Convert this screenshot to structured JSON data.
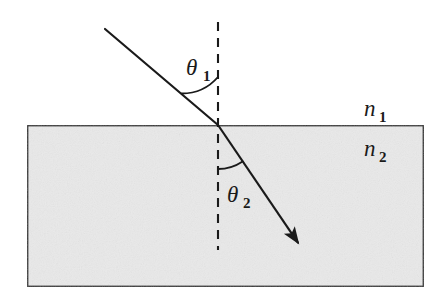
{
  "diagram": {
    "background_color": "#ffffff",
    "stroke_color": "#1a1a1a",
    "medium_fill_color": "#e9e9e9",
    "medium_border_color": "#333333",
    "labels": {
      "theta1_symbol": "θ",
      "theta1_subscript": "1",
      "theta2_symbol": "θ",
      "theta2_subscript": "2",
      "n1_symbol": "n",
      "n1_subscript": "1",
      "n2_symbol": "n",
      "n2_subscript": "2"
    },
    "geometry": {
      "medium_rect": {
        "x": 27,
        "y": 125,
        "width": 397,
        "height": 162
      },
      "interface_y": 125,
      "normal_line": {
        "x": 218,
        "y_top": 22,
        "y_bottom": 250
      },
      "incident_ray": {
        "x1": 105,
        "y1": 29,
        "x2": 218,
        "y2": 125
      },
      "refracted_ray": {
        "x1": 218,
        "y1": 125,
        "x2": 305,
        "y2": 253
      },
      "incidence_point": {
        "x": 218,
        "y": 125
      },
      "theta1_arc_radius": 48,
      "theta2_arc_radius": 44
    },
    "label_positions": {
      "theta1": {
        "x": 186,
        "y": 75
      },
      "theta1_sub": {
        "x": 203,
        "y": 81
      },
      "theta2": {
        "x": 227,
        "y": 202
      },
      "theta2_sub": {
        "x": 243,
        "y": 208
      },
      "n1": {
        "x": 364,
        "y": 116
      },
      "n1_sub": {
        "x": 379,
        "y": 122
      },
      "n2": {
        "x": 364,
        "y": 156
      },
      "n2_sub": {
        "x": 379,
        "y": 162
      }
    },
    "angles_degrees": {
      "theta1_from_normal": 49,
      "theta2_from_normal": 34
    }
  }
}
